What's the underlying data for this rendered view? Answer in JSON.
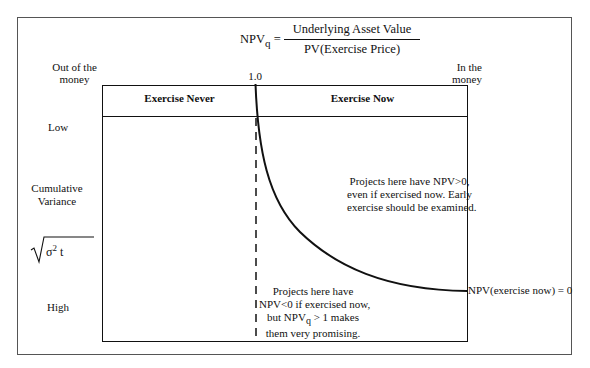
{
  "formula": {
    "lhs": "NPV",
    "lhs_sub": "q",
    "equals": "=",
    "numerator": "Underlying Asset Value",
    "denominator": "PV(Exercise Price)"
  },
  "x_axis": {
    "left_label_line1": "Out of the",
    "left_label_line2": "money",
    "center_tick": "1.0",
    "right_label_line1": "In the",
    "right_label_line2": "money"
  },
  "y_axis": {
    "top_label": "Low",
    "title_line1": "Cumulative",
    "title_line2": "Variance",
    "formula_sigma": "σ",
    "formula_exp": "2",
    "formula_t": "t",
    "bottom_label": "High"
  },
  "regions": {
    "left_header": "Exercise Never",
    "right_header": "Exercise Now"
  },
  "annotations": {
    "upper_right_line1": "Projects here have NPV>0,",
    "upper_right_line2": "even if exercised now.  Early",
    "upper_right_line3": "exercise should be examined.",
    "lower_line1": "Projects here have",
    "lower_line2": "NPV<0 if exercised now,",
    "lower_line3_pre": "but NPV",
    "lower_line3_sub": "q",
    "lower_line3_post": " > 1 makes",
    "lower_line4": "them very promising.",
    "curve_label": "NPV(exercise now) = 0"
  },
  "colors": {
    "line": "#111111",
    "frame": "#555555",
    "background": "#ffffff"
  }
}
